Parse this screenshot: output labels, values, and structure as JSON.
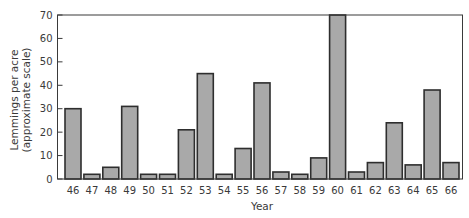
{
  "chart_data": {
    "type": "bar",
    "title": "",
    "xlabel": "Year",
    "ylabel": "Lemmings per acre",
    "ylabel_sub": "(approximate scale)",
    "ylim": [
      0,
      70
    ],
    "yticks": [
      0,
      10,
      20,
      30,
      40,
      50,
      60,
      70
    ],
    "grid": false,
    "legend": null,
    "categories": [
      "46",
      "47",
      "48",
      "49",
      "50",
      "51",
      "52",
      "53",
      "54",
      "55",
      "56",
      "57",
      "58",
      "59",
      "60",
      "61",
      "62",
      "63",
      "64",
      "65",
      "66"
    ],
    "values": [
      30,
      2,
      5,
      31,
      2,
      2,
      21,
      45,
      2,
      13,
      41,
      3,
      2,
      9,
      70,
      3,
      7,
      24,
      6,
      38,
      7
    ],
    "annotations": [
      "Bar for year 60 extends to/above top of axis (clipped at 70)"
    ],
    "colors": {
      "bar_fill": "#a9a9a9",
      "bar_stroke": "#2e2e2e",
      "axis": "#3a3a3a"
    }
  }
}
